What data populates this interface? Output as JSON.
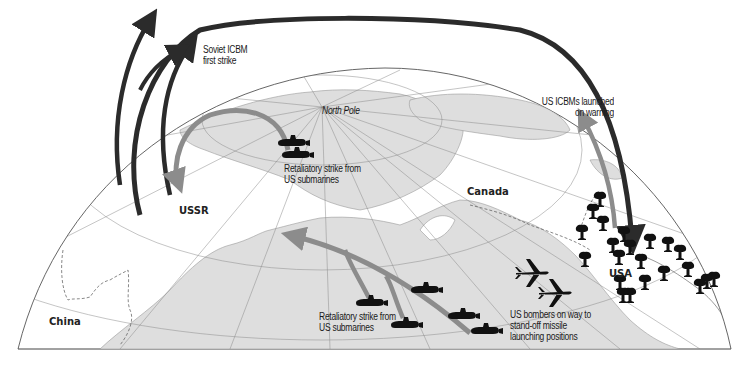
{
  "diagram": {
    "type": "map",
    "colors": {
      "background": "#ffffff",
      "land": "#dedede",
      "land_outline": "#9a9a9a",
      "grid": "#8a8a8a",
      "soviet_arrow": "#2b2b2b",
      "us_arrow": "#8c8c8c",
      "icons": "#111111"
    },
    "labels": {
      "soviet_icbm": "Soviet ICBM\nfirst strike",
      "north_pole": "North Pole",
      "retaliatory_top": "Retaliatory strike from\nUS submarines",
      "us_icbms": "US ICBMs launched\non warning",
      "ussr": "USSR",
      "canada": "Canada",
      "usa": "USA",
      "china": "China",
      "retaliatory_bottom": "Retaliatory strike from\nUS submarines",
      "bombers": "US bombers on way to\nstand-off missile\nlaunching positions"
    },
    "icons": {
      "submarines": 7,
      "bombers": 2,
      "mushroom_clouds": 22,
      "submarine_icon": "submarine-icon",
      "bomber_icon": "bomber-icon",
      "explosion_icon": "mushroom-cloud-icon"
    }
  }
}
